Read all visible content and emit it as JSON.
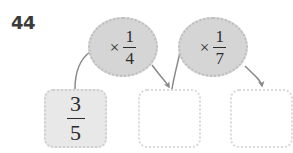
{
  "worksheet": {
    "question_number": "44",
    "type": "fraction-function-machine"
  },
  "operators": [
    {
      "id": "operator-1",
      "sign": "×",
      "numerator": "1",
      "denominator": "4",
      "label": "× 1/4"
    },
    {
      "id": "operator-2",
      "sign": "×",
      "numerator": "1",
      "denominator": "7",
      "label": "× 1/7"
    }
  ],
  "boxes": [
    {
      "id": "box-1",
      "state": "filled",
      "numerator": "3",
      "denominator": "5",
      "value": "3/5"
    },
    {
      "id": "box-2",
      "state": "empty",
      "numerator": "",
      "denominator": "",
      "value": ""
    },
    {
      "id": "box-3",
      "state": "empty",
      "numerator": "",
      "denominator": "",
      "value": ""
    }
  ],
  "arrows": [
    {
      "id": "arrow-box1-to-op1",
      "from": "box-1",
      "to": "operator-1",
      "direction": "up-right"
    },
    {
      "id": "arrow-op1-to-box2",
      "from": "operator-1",
      "to": "box-2",
      "direction": "down-left"
    },
    {
      "id": "arrow-box2-to-op2",
      "from": "box-2",
      "to": "operator-2",
      "direction": "up-right"
    },
    {
      "id": "arrow-op2-to-box3",
      "from": "operator-2",
      "to": "box-3",
      "direction": "down-right"
    }
  ],
  "colors": {
    "oval_fill": "#d5d5d5",
    "oval_border": "#bdbdbd",
    "box_filled": "#e8e8e8",
    "box_border": "#d9d9d9",
    "arrow": "#8a8a8a",
    "text": "#2c2c2c",
    "number_text": "#3b3b3b",
    "page_background": "#ffffff"
  }
}
